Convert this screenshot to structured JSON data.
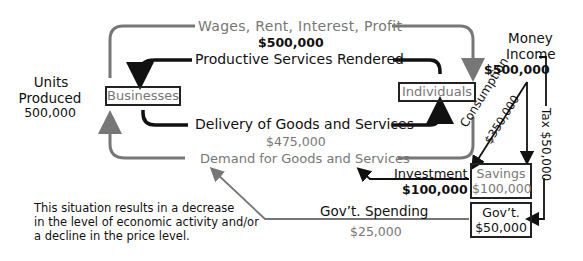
{
  "diagram": {
    "flows": {
      "wages_label": "Wages, Rent, Interest, Profit",
      "wages_amount": "$500,000",
      "productive_label": "Productive Services Rendered",
      "delivery_label": "Delivery of Goods and Services",
      "delivery_amount": "$475,000",
      "demand_label": "Demand for Goods and Services",
      "money_income_line1": "Money",
      "money_income_line2": "Income",
      "money_income_amount": "$500,000",
      "consumption_label": "Consumption",
      "consumption_amount": "$350,000",
      "tax_label": "Tax  $50,000",
      "investment_label": "Investment",
      "investment_amount": "$100,000",
      "govt_spending_label": "Gov’t. Spending",
      "govt_spending_amount": "$25,000"
    },
    "nodes": {
      "businesses": "Businesses",
      "individuals": "Individuals",
      "savings_label": "Savings",
      "savings_amount": "$100,000",
      "govt_label": "Gov’t.",
      "govt_amount": "$50,000"
    },
    "units": {
      "line1": "Units",
      "line2": "Produced",
      "line3": "500,000"
    },
    "note": {
      "line1": "This situation results in a decrease",
      "line2": "in the level of economic activity and/or",
      "line3": "a decline in the price level."
    },
    "colors": {
      "dark": "#111111",
      "gray": "#7a7a7a"
    }
  }
}
